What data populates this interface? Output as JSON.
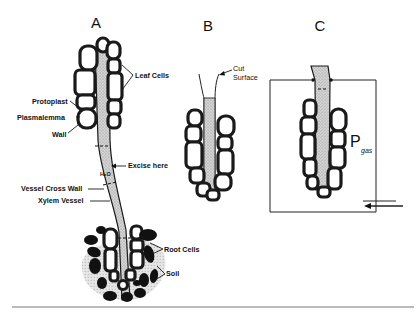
{
  "figure": {
    "panels": [
      {
        "id": "A",
        "letter": "A"
      },
      {
        "id": "B",
        "letter": "B"
      },
      {
        "id": "C",
        "letter": "C"
      }
    ],
    "labels": {
      "leaf_cells": "Leaf Cells",
      "protoplast": "Protoplast",
      "plasmalemma": "Plasmalemma",
      "wall": "Wall",
      "excise_here": "Excise here",
      "h2o": "H₂O",
      "vessel_cross_wall": "Vessel Cross Wall",
      "xylem_vessel": "Xylem Vessel",
      "root_cells": "Root Cells",
      "soil": "Soil",
      "cut_surface_line1": "Cut",
      "cut_surface_line2": "Surface",
      "p_gas_main": "P",
      "p_gas_sub": "gas"
    },
    "colors": {
      "ink": "#111111",
      "vessel_fill": "#c8c8c8",
      "background": "#ffffff"
    }
  }
}
